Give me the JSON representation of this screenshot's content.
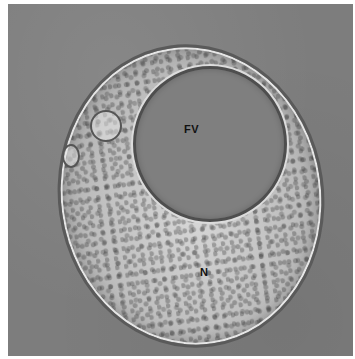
{
  "image": {
    "description": "Transmission electron micrograph of a round cell with a large clear food vacuole",
    "background_color": "#7d7d7d",
    "labels": [
      {
        "id": "fv",
        "text": "FV",
        "meaning": "food vacuole"
      },
      {
        "id": "n",
        "text": "N",
        "meaning": "nucleus"
      }
    ]
  }
}
